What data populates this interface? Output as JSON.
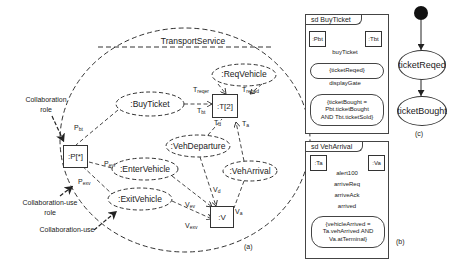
{
  "panel_a": {
    "caption": "(a)",
    "collaboration_name": "TransportService",
    "parts": {
      "passenger": ":P[*]",
      "terminal": ":T[2]",
      "vehicle": ":V"
    },
    "collaboration_uses": {
      "buy_ticket": ":BuyTicket",
      "req_vehicle": ":ReqVehicle",
      "veh_departure": ":VehDeparture",
      "veh_arrival": ":VehArrival",
      "enter_vehicle": ":EnterVehicle",
      "exit_vehicle": ":ExitVehicle"
    },
    "role_labels": {
      "p_bt": {
        "base": "P",
        "sub": "bt"
      },
      "p_evl": {
        "base": "P",
        "sub": "evl"
      },
      "p_exv": {
        "base": "P",
        "sub": "exv"
      },
      "t_reqer": {
        "base": "T",
        "sub": "reqer"
      },
      "t_reqed": {
        "base": "T",
        "sub": "reqed"
      },
      "t_bt": {
        "base": "T",
        "sub": "bt"
      },
      "t_d": {
        "base": "T",
        "sub": "d"
      },
      "t_a": {
        "base": "T",
        "sub": "a"
      },
      "v_d": {
        "base": "V",
        "sub": "d"
      },
      "v_ev": {
        "base": "V",
        "sub": "ev"
      },
      "v_exv": {
        "base": "V",
        "sub": "exv"
      },
      "v_a": {
        "base": "V",
        "sub": "a"
      }
    },
    "annotations": {
      "collaboration_role_line1": "Collaboration",
      "collaboration_role_line2": "role",
      "collaboration_use_role_line1": "Collaboration-use",
      "collaboration_use_role_line2": "role",
      "collaboration_use": "Collaboration-use"
    }
  },
  "panel_b": {
    "caption": "(b)",
    "buy_ticket": {
      "frame_label": "sd BuyTicket",
      "lifelines": [
        ":Pbt",
        ":Tbt"
      ],
      "messages": [
        {
          "label": "buyTicket",
          "direction": "right"
        },
        {
          "label": "displayGate",
          "direction": "left"
        }
      ],
      "states": [
        "{ticketReqed}",
        "{ticketBought =\nPbt.ticketBought\nAND Tbt.ticketSold}"
      ]
    },
    "veh_arrival": {
      "frame_label": "sd VehArrival",
      "lifelines": [
        ":Ta",
        ":Va"
      ],
      "messages": [
        {
          "label": "alert100",
          "direction": "left"
        },
        {
          "label": "arriveReq",
          "direction": "left"
        },
        {
          "label": "arriveAck",
          "direction": "right"
        },
        {
          "label": "arrived",
          "direction": "left"
        }
      ],
      "states": [
        "{vehicleArrived =\nTa.vehArrived AND\nVa.atTerminal}"
      ]
    }
  },
  "panel_c": {
    "caption": "(c)",
    "states": [
      "ticketReqed",
      "ticketBought"
    ]
  }
}
